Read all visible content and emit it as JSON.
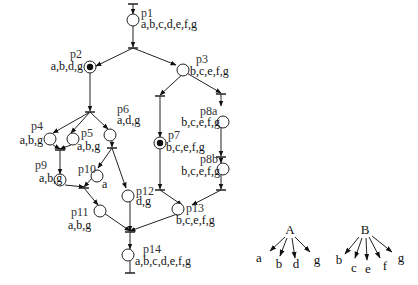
{
  "places": {
    "p1": {
      "name": "p1",
      "label": "a,b,c,d,e,f,g"
    },
    "p2": {
      "name": "p2",
      "label": "a,b,d,g"
    },
    "p3": {
      "name": "p3",
      "label": "b,c,e,f,g"
    },
    "p4": {
      "name": "p4",
      "label": "a,b,g"
    },
    "p5": {
      "name": "p5",
      "label": "a,b,g"
    },
    "p6": {
      "name": "p6",
      "label": "a,d,g"
    },
    "p7": {
      "name": "p7",
      "label": "b,c,e,f,g"
    },
    "p8a": {
      "name": "p8a",
      "label": "b,c,e,f,g"
    },
    "p8b": {
      "name": "p8b",
      "label": "b,c,e,f,g"
    },
    "p9": {
      "name": "p9",
      "label": "a,b,g"
    },
    "p10": {
      "name": "p10",
      "label": "a"
    },
    "p11": {
      "name": "p11",
      "label": "a,b,g"
    },
    "p12": {
      "name": "p12",
      "label": "d,g"
    },
    "p13": {
      "name": "p13",
      "label": "b,c,e,f,g"
    },
    "p14": {
      "name": "p14",
      "label": "a,b,c,d,e,f,g"
    }
  },
  "marked_places": [
    "p2",
    "p7"
  ],
  "trees": {
    "A": {
      "root": "A",
      "children": [
        "a",
        "b",
        "d",
        "g"
      ]
    },
    "B": {
      "root": "B",
      "children": [
        "b",
        "c",
        "e",
        "f",
        "g"
      ]
    }
  }
}
